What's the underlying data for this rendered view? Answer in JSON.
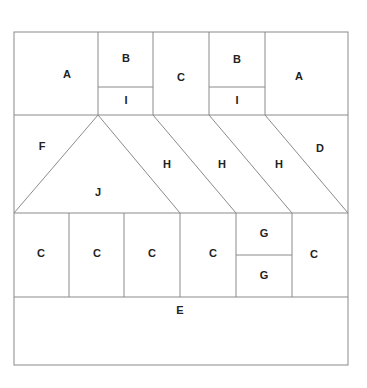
{
  "diagram": {
    "type": "quilt-block-layout",
    "frame": {
      "x1": 14,
      "y1": 32,
      "x2": 348,
      "y2": 365
    },
    "colors": {
      "line": "#8a8a8a",
      "label": "#222222",
      "background": "#ffffff"
    },
    "lines": [
      {
        "id": "row1-bottom",
        "x1": 14,
        "y1": 115,
        "x2": 348,
        "y2": 115
      },
      {
        "id": "row2-bottom",
        "x1": 14,
        "y1": 213,
        "x2": 348,
        "y2": 213
      },
      {
        "id": "row3-bottom",
        "x1": 14,
        "y1": 297,
        "x2": 348,
        "y2": 297
      },
      {
        "id": "v-a1",
        "x1": 98,
        "y1": 32,
        "x2": 98,
        "y2": 115
      },
      {
        "id": "v-b1",
        "x1": 153,
        "y1": 32,
        "x2": 153,
        "y2": 115
      },
      {
        "id": "v-c1",
        "x1": 209,
        "y1": 32,
        "x2": 209,
        "y2": 115
      },
      {
        "id": "v-b2",
        "x1": 265,
        "y1": 32,
        "x2": 265,
        "y2": 115
      },
      {
        "id": "bi-1",
        "x1": 98,
        "y1": 87,
        "x2": 153,
        "y2": 87
      },
      {
        "id": "bi-2",
        "x1": 209,
        "y1": 87,
        "x2": 265,
        "y2": 87
      },
      {
        "id": "diag-j-left",
        "x1": 98,
        "y1": 115,
        "x2": 14,
        "y2": 213
      },
      {
        "id": "diag-j-right",
        "x1": 98,
        "y1": 115,
        "x2": 180,
        "y2": 213
      },
      {
        "id": "diag-h1",
        "x1": 153,
        "y1": 115,
        "x2": 236,
        "y2": 213
      },
      {
        "id": "diag-h2",
        "x1": 209,
        "y1": 115,
        "x2": 292,
        "y2": 213
      },
      {
        "id": "diag-d",
        "x1": 265,
        "y1": 115,
        "x2": 348,
        "y2": 213
      },
      {
        "id": "v-r3-1",
        "x1": 69,
        "y1": 213,
        "x2": 69,
        "y2": 297
      },
      {
        "id": "v-r3-2",
        "x1": 124,
        "y1": 213,
        "x2": 124,
        "y2": 297
      },
      {
        "id": "v-r3-3",
        "x1": 180,
        "y1": 213,
        "x2": 180,
        "y2": 297
      },
      {
        "id": "v-r3-4",
        "x1": 236,
        "y1": 213,
        "x2": 236,
        "y2": 297
      },
      {
        "id": "v-r3-5",
        "x1": 292,
        "y1": 213,
        "x2": 292,
        "y2": 297
      },
      {
        "id": "g-divider",
        "x1": 236,
        "y1": 255,
        "x2": 292,
        "y2": 255
      }
    ],
    "labels": [
      {
        "text": "A",
        "x": 67,
        "y": 75
      },
      {
        "text": "B",
        "x": 126,
        "y": 59
      },
      {
        "text": "I",
        "x": 126,
        "y": 101
      },
      {
        "text": "C",
        "x": 181,
        "y": 78
      },
      {
        "text": "B",
        "x": 237,
        "y": 60
      },
      {
        "text": "I",
        "x": 237,
        "y": 101
      },
      {
        "text": "A",
        "x": 299,
        "y": 77
      },
      {
        "text": "F",
        "x": 42,
        "y": 147
      },
      {
        "text": "H",
        "x": 167,
        "y": 165
      },
      {
        "text": "H",
        "x": 222,
        "y": 165
      },
      {
        "text": "H",
        "x": 279,
        "y": 165
      },
      {
        "text": "D",
        "x": 320,
        "y": 149
      },
      {
        "text": "J",
        "x": 98,
        "y": 193
      },
      {
        "text": "C",
        "x": 41,
        "y": 254
      },
      {
        "text": "C",
        "x": 97,
        "y": 254
      },
      {
        "text": "C",
        "x": 152,
        "y": 254
      },
      {
        "text": "C",
        "x": 213,
        "y": 254
      },
      {
        "text": "G",
        "x": 264,
        "y": 234
      },
      {
        "text": "G",
        "x": 264,
        "y": 276
      },
      {
        "text": "C",
        "x": 314,
        "y": 255
      },
      {
        "text": "E",
        "x": 180,
        "y": 311
      }
    ]
  }
}
